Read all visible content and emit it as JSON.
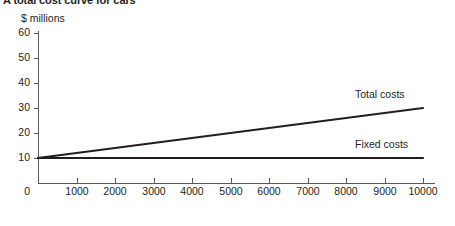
{
  "chart_data": {
    "type": "line",
    "title": "A total cost curve for cars",
    "xlabel": "Output of cars per month",
    "ylabel": "$ millions",
    "xlim": [
      0,
      10000
    ],
    "ylim": [
      0,
      60
    ],
    "grid": false,
    "legend_position": "inline-right",
    "categories": [
      0,
      1000,
      2000,
      3000,
      4000,
      5000,
      6000,
      7000,
      8000,
      9000,
      10000
    ],
    "x_tick_labels": [
      "1000",
      "2000",
      "3000",
      "4000",
      "5000",
      "6000",
      "7000",
      "8000",
      "9000",
      "10000"
    ],
    "y_tick_labels": [
      "0",
      "10",
      "20",
      "30",
      "40",
      "50",
      "60"
    ],
    "y_ticks": [
      0,
      10,
      20,
      30,
      40,
      50,
      60
    ],
    "series": [
      {
        "name": "Total costs",
        "x": [
          0,
          1000,
          2000,
          3000,
          4000,
          5000,
          6000,
          7000,
          8000,
          9000,
          10000
        ],
        "values": [
          10,
          12,
          14,
          16,
          18,
          20,
          22,
          24,
          26,
          28,
          30
        ],
        "color": "#231f20"
      },
      {
        "name": "Fixed costs",
        "x": [
          0,
          1000,
          2000,
          3000,
          4000,
          5000,
          6000,
          7000,
          8000,
          9000,
          10000
        ],
        "values": [
          10,
          10,
          10,
          10,
          10,
          10,
          10,
          10,
          10,
          10,
          10
        ],
        "color": "#231f20"
      }
    ],
    "annotations": [
      {
        "text": "Total costs",
        "x": 8000,
        "y": 33
      },
      {
        "text": "Fixed costs",
        "x": 8000,
        "y": 13
      }
    ]
  },
  "colors": {
    "axis": "#58595b",
    "line": "#231f20",
    "text": "#231f20",
    "background": "#ffffff"
  }
}
